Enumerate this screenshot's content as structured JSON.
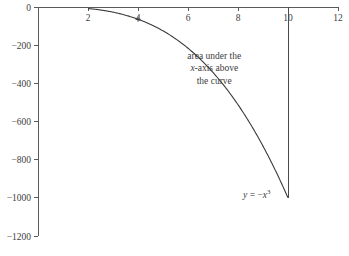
{
  "chart_data": {
    "type": "line",
    "title": "",
    "subtitle": "",
    "xlabel": "",
    "ylabel": "",
    "xlim": [
      0,
      12
    ],
    "ylim": [
      -1200,
      0
    ],
    "grid": false,
    "legend": "none",
    "x_ticks": [
      2,
      4,
      6,
      8,
      10,
      12
    ],
    "x_tick_labels": [
      "2",
      "4",
      "6",
      "8",
      "10",
      "12"
    ],
    "y_ticks": [
      0,
      -200,
      -400,
      -600,
      -800,
      -1000,
      -1200
    ],
    "y_tick_labels": [
      "0",
      "−200",
      "−400",
      "−600",
      "−800",
      "−1000",
      "−1200"
    ],
    "series": [
      {
        "name": "y = -x^3",
        "equation": "y = −x³",
        "x": [
          2,
          2.5,
          3,
          3.5,
          4,
          4.5,
          5,
          5.5,
          6,
          6.5,
          7,
          7.5,
          8,
          8.5,
          9,
          9.5,
          10
        ],
        "values": [
          -8,
          -15.6,
          -27,
          -42.9,
          -64,
          -91.1,
          -125,
          -166.4,
          -216,
          -274.6,
          -343,
          -421.9,
          -512,
          -614.1,
          -729,
          -857.4,
          -1000
        ]
      }
    ],
    "markers": [
      {
        "name": "curve-point-marker",
        "x": 4,
        "y": -64
      }
    ],
    "bounding_lines": [
      {
        "name": "right-boundary",
        "x": 10,
        "y_from": 0,
        "y_to": -1000
      }
    ],
    "annotations": [
      {
        "name": "area-annotation",
        "lines": [
          "area under the",
          "x-axis above",
          "the curve"
        ],
        "x": 7.05,
        "y": -270
      },
      {
        "name": "equation-annotation",
        "base": "y = −x",
        "exponent": "3",
        "x": 9.3,
        "y": -1000
      }
    ],
    "colors": {
      "axis": "#5a5a5a",
      "curve": "#3a3a3a",
      "boundary": "#4a4a4a",
      "text": "#3d3d3d",
      "background": "#ffffff"
    }
  }
}
